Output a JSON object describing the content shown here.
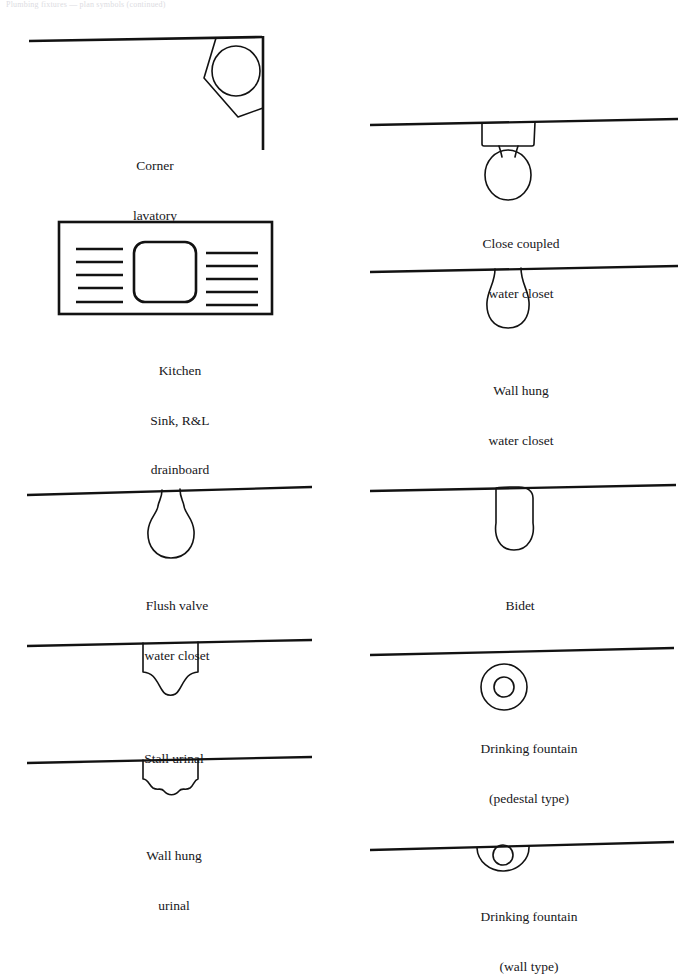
{
  "page": {
    "header_text": "Plumbing fixtures — plan symbols (continued)",
    "width": 686,
    "height": 938,
    "background_color": "#ffffff",
    "ink_color": "#121212"
  },
  "figures": [
    {
      "id": "corner-lavatory",
      "symbol": "corner-lavatory-symbol",
      "caption_lines": [
        "Corner",
        "lavatory"
      ],
      "column": "left"
    },
    {
      "id": "kitchen-sink",
      "symbol": "kitchen-sink-symbol",
      "caption_lines": [
        "Kitchen",
        "Sink, R&L",
        "drainboard"
      ],
      "column": "left"
    },
    {
      "id": "close-coupled-water-closet",
      "symbol": "close-coupled-water-closet-symbol",
      "caption_lines": [
        "Close coupled",
        "water closet"
      ],
      "column": "right"
    },
    {
      "id": "wall-hung-water-closet",
      "symbol": "wall-hung-water-closet-symbol",
      "caption_lines": [
        "Wall hung",
        "water closet"
      ],
      "column": "right"
    },
    {
      "id": "flush-valve-water-closet",
      "symbol": "flush-valve-water-closet-symbol",
      "caption_lines": [
        "Flush valve",
        "water closet"
      ],
      "column": "left"
    },
    {
      "id": "bidet",
      "symbol": "bidet-symbol",
      "caption_lines": [
        "Bidet"
      ],
      "column": "right"
    },
    {
      "id": "stall-urinal",
      "symbol": "stall-urinal-symbol",
      "caption_lines": [
        "Stall urinal"
      ],
      "column": "left"
    },
    {
      "id": "drinking-fountain-pedestal",
      "symbol": "drinking-fountain-pedestal-symbol",
      "caption_lines": [
        "Drinking fountain",
        "(pedestal type)"
      ],
      "column": "right"
    },
    {
      "id": "wall-hung-urinal",
      "symbol": "wall-hung-urinal-symbol",
      "caption_lines": [
        "Wall hung",
        "urinal"
      ],
      "column": "left"
    },
    {
      "id": "drinking-fountain-wall",
      "symbol": "drinking-fountain-wall-symbol",
      "caption_lines": [
        "Drinking fountain",
        "(wall type)"
      ],
      "column": "right"
    }
  ]
}
